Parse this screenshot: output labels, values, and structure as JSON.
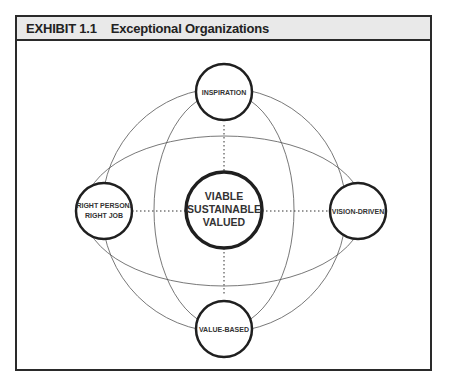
{
  "exhibit": {
    "number": "EXHIBIT 1.1",
    "title": "Exceptional Organizations"
  },
  "diagram": {
    "center": {
      "lines": [
        "VIABLE",
        "SUSTAINABLE",
        "VALUED"
      ]
    },
    "nodes": {
      "top": {
        "lines": [
          "INSPIRATION"
        ]
      },
      "right": {
        "lines": [
          "VISION-DRIVEN"
        ]
      },
      "bottom": {
        "lines": [
          "VALUE-BASED"
        ]
      },
      "left": {
        "lines": [
          "RIGHT PERSON/",
          "RIGHT JOB"
        ]
      }
    },
    "colors": {
      "stroke": "#222222",
      "thin_line": "#555555",
      "header_bg": "#e9e9e9"
    }
  }
}
